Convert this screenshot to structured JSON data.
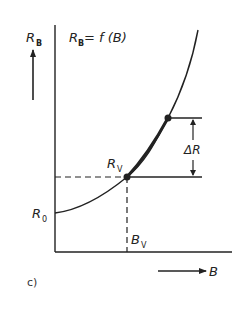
{
  "figure": {
    "panel_label": "c)",
    "equation": {
      "main": "R",
      "sub": "B",
      "rest": " = f (B)"
    },
    "y_axis": {
      "label_main": "R",
      "label_sub": "B"
    },
    "x_axis": {
      "label": "B"
    },
    "r0": {
      "main": "R",
      "sub": "0"
    },
    "rv": {
      "main": "R",
      "sub": "V"
    },
    "bv": {
      "main": "B",
      "sub": "V"
    },
    "delta_r": "ΔR",
    "colors": {
      "line": "#222222",
      "background": "#ffffff"
    }
  }
}
